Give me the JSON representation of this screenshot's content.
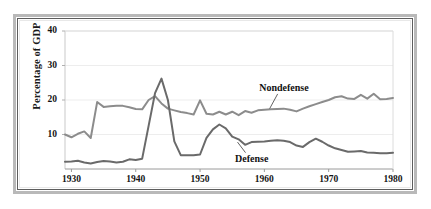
{
  "figure": {
    "frame_style": "double-ruled-border",
    "background_color": "#ffffff"
  },
  "chart_data": {
    "type": "line",
    "title": "",
    "subtitle": "",
    "xlabel": "",
    "ylabel": "Percentage of GDP",
    "xlim": [
      1929,
      1980
    ],
    "ylim": [
      0,
      40
    ],
    "grid": true,
    "grid_axis": "y",
    "grid_color": "#ededed",
    "legend_position": "inline-annotations",
    "y_ticks": [
      10,
      20,
      30,
      40
    ],
    "y_tick_labels": [
      "10",
      "20",
      "30",
      "40"
    ],
    "x_ticks": [
      1930,
      1940,
      1950,
      1960,
      1970,
      1980
    ],
    "x_tick_labels": [
      "1930",
      "1940",
      "1950",
      "1960",
      "1970",
      "1980"
    ],
    "annotations": [
      {
        "text": "Nondefense",
        "series": "Nondefense",
        "x": 1963,
        "y": 23.5
      },
      {
        "text": "Defense",
        "series": "Defense",
        "x": 1958,
        "y": 3.0
      }
    ],
    "series": [
      {
        "name": "Nondefense",
        "color": "#8c8c8c",
        "line_width": 2.0,
        "x": [
          1929,
          1930,
          1931,
          1932,
          1933,
          1934,
          1935,
          1936,
          1937,
          1938,
          1939,
          1940,
          1941,
          1942,
          1943,
          1944,
          1945,
          1946,
          1947,
          1948,
          1949,
          1950,
          1951,
          1952,
          1953,
          1954,
          1955,
          1956,
          1957,
          1958,
          1959,
          1960,
          1961,
          1962,
          1963,
          1964,
          1965,
          1966,
          1967,
          1968,
          1969,
          1970,
          1971,
          1972,
          1973,
          1974,
          1975,
          1976,
          1977,
          1978,
          1979,
          1980
        ],
        "values": [
          10.0,
          9.2,
          10.2,
          10.9,
          9.0,
          19.4,
          18.0,
          18.2,
          18.3,
          18.3,
          17.9,
          17.4,
          17.3,
          20.0,
          21.1,
          19.0,
          17.5,
          17.0,
          16.5,
          16.2,
          15.8,
          19.9,
          16.0,
          15.8,
          16.6,
          15.8,
          16.6,
          15.6,
          16.8,
          16.3,
          17.0,
          17.2,
          17.3,
          17.4,
          17.5,
          17.2,
          16.7,
          17.5,
          18.2,
          18.8,
          19.4,
          20.0,
          20.8,
          21.1,
          20.4,
          20.3,
          21.5,
          20.4,
          21.8,
          20.2,
          20.3,
          20.6
        ]
      },
      {
        "name": "Defense",
        "color": "#6a6a6a",
        "line_width": 2.0,
        "x": [
          1929,
          1930,
          1931,
          1932,
          1933,
          1934,
          1935,
          1936,
          1937,
          1938,
          1939,
          1940,
          1941,
          1942,
          1943,
          1944,
          1945,
          1946,
          1947,
          1948,
          1949,
          1950,
          1951,
          1952,
          1953,
          1954,
          1955,
          1956,
          1957,
          1958,
          1959,
          1960,
          1961,
          1962,
          1963,
          1964,
          1965,
          1966,
          1967,
          1968,
          1969,
          1970,
          1971,
          1972,
          1973,
          1974,
          1975,
          1976,
          1977,
          1978,
          1979,
          1980
        ],
        "values": [
          2.1,
          2.2,
          2.4,
          1.9,
          1.6,
          2.0,
          2.3,
          2.2,
          1.9,
          2.1,
          2.8,
          2.6,
          3.0,
          12.5,
          22.0,
          26.2,
          20.0,
          8.0,
          4.0,
          4.0,
          4.0,
          4.2,
          9.0,
          11.5,
          12.9,
          11.8,
          9.4,
          8.6,
          7.0,
          7.8,
          7.9,
          8.0,
          8.2,
          8.3,
          8.2,
          7.8,
          6.8,
          6.4,
          7.8,
          8.8,
          7.9,
          6.8,
          6.0,
          5.5,
          5.0,
          5.1,
          5.2,
          4.8,
          4.7,
          4.6,
          4.6,
          4.7
        ]
      }
    ]
  }
}
